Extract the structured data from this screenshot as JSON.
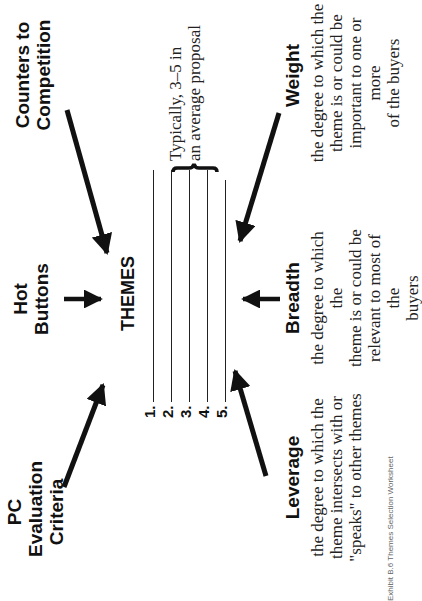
{
  "diagram": {
    "center_label": "THEMES",
    "inputs": [
      {
        "id": "pc-evaluation-criteria",
        "label": "PC Evaluation Criteria",
        "lines": [
          "PC",
          "Evaluation",
          "Criteria"
        ]
      },
      {
        "id": "hot-buttons",
        "label": "Hot Buttons",
        "lines": [
          "Hot",
          "Buttons"
        ]
      },
      {
        "id": "counters-to-competition",
        "label": "Counters to Competition",
        "lines": [
          "Counters to",
          "Competition"
        ]
      }
    ],
    "criteria": [
      {
        "id": "leverage",
        "label": "Leverage",
        "description": "the degree to which the theme intersects with or \"speaks\" to other themes",
        "desc_lines": [
          "the degree to which the",
          "theme intersects with or",
          "\"speaks\" to other themes"
        ]
      },
      {
        "id": "breadth",
        "label": "Breadth",
        "description": "the degree to which the theme is or could be relevant to most of the buyers",
        "desc_lines": [
          "the degree to which the",
          "theme is or could be",
          "relevant to most of the",
          "buyers"
        ]
      },
      {
        "id": "weight",
        "label": "Weight",
        "description": "the degree to which the theme is or could be important to one or more of the buyers",
        "desc_lines": [
          "the degree to which the",
          "theme is or could be",
          "important to one or more",
          "of the buyers"
        ]
      }
    ],
    "theme_slots": [
      "1.",
      "2.",
      "3.",
      "4.",
      "5."
    ],
    "brace_note": {
      "lines": [
        "Typically, 3–5 in",
        "an average proposal"
      ]
    },
    "caption": "Exhibit B.6   Themes Selection Worksheet",
    "colors": {
      "ink": "#111111",
      "background": "#ffffff"
    }
  }
}
